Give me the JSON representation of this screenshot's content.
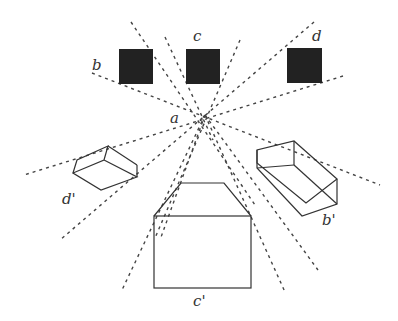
{
  "diagram": {
    "type": "hand-drawn perspective / projection diagram",
    "center_label": "a",
    "objects": [
      {
        "label": "b",
        "shape": "black square"
      },
      {
        "label": "c",
        "shape": "black square"
      },
      {
        "label": "d",
        "shape": "black square"
      },
      {
        "label": "d'",
        "shape": "projected box (left)"
      },
      {
        "label": "c'",
        "shape": "projected box (bottom)"
      },
      {
        "label": "b'",
        "shape": "projected box (right)"
      }
    ],
    "labels": {
      "a": "a",
      "b": "b",
      "c": "c",
      "d": "d",
      "d_prime": "d'",
      "c_prime": "c'",
      "b_prime": "b'"
    },
    "colors": {
      "ink": "#333333",
      "fill": "#222222",
      "background": "#ffffff"
    }
  }
}
